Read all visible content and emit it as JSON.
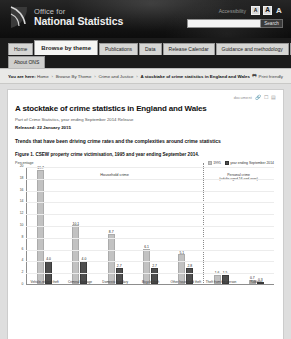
{
  "site": {
    "org_line1": "Office for",
    "org_line2": "National Statistics",
    "logo_icon": "ons-swoosh-logo",
    "accessibility_label": "Accessibility",
    "accessibility_buttons": [
      "A",
      "A",
      "A"
    ],
    "search_value": "",
    "search_placeholder": "",
    "search_button": "Search"
  },
  "nav": {
    "primary": [
      "Home",
      "Browse by theme",
      "Publications",
      "Data",
      "Release Calendar",
      "Guidance and methodology",
      "Media centre"
    ],
    "secondary": [
      "About ONS"
    ],
    "active": "Browse by theme"
  },
  "breadcrumb": {
    "prefix": "You are here:",
    "items": [
      "Home",
      "Browse By Theme",
      "Crime and Justice"
    ],
    "current": "A stocktake of crime statistics in England and Wales",
    "separator": "›",
    "print_icon": "printer-icon",
    "print_label": "Print friendly"
  },
  "article": {
    "tools_label": "document",
    "tools_icons": [
      "link-icon",
      "share-icon",
      "print-icon"
    ],
    "title": "A stocktake of crime statistics in England and Wales",
    "subtitle": "Part of Crime Statistics, year ending September 2014 Release",
    "released_label": "Released: 22 January 2015",
    "lead": "Trends that have been driving crime rates and the complexities around crime statistics"
  },
  "chart_data": {
    "type": "bar",
    "title": "Figure 1. CSEW property crime victimisation, 1995 and year ending September 2014.",
    "ylabel": "Percentage",
    "xlabel": "",
    "ylim": [
      0,
      20
    ],
    "yticks": [
      0,
      2,
      4,
      6,
      8,
      10,
      12,
      14,
      16,
      18,
      20
    ],
    "grid": true,
    "legend_position": "top-right",
    "categories": [
      "Vehicle-related theft",
      "Criminal damage",
      "Domestic burglary",
      "Bicycle theft",
      "Other household theft",
      "Theft from the person",
      "Robbery"
    ],
    "groups": [
      {
        "label": "Household crime",
        "categories": 5
      },
      {
        "label": "Personal crime",
        "sublabel": "(adults aged 16 and over)",
        "categories": 2
      }
    ],
    "series": [
      {
        "name": "1995",
        "color": "#c2c2c2",
        "values": [
          19.7,
          10.1,
          8.7,
          6.1,
          5.1,
          1.6,
          0.7
        ]
      },
      {
        "name": "year ending September 2014",
        "color": "#4e4e4e",
        "values": [
          4.0,
          4.0,
          2.7,
          2.7,
          2.8,
          1.5,
          0.3
        ]
      }
    ]
  }
}
